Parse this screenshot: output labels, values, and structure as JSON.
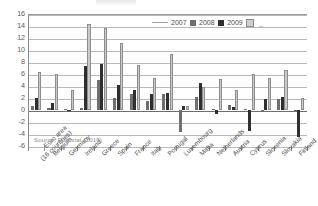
{
  "source_note": "Source:  Eurostat (2010)",
  "legend": {
    "items": [
      {
        "label": "2007",
        "swatch": "solid-gray-swatch",
        "color": "#6f6f6f"
      },
      {
        "label": "2008",
        "swatch": "solid-black-swatch",
        "color": "#2f2f2f"
      },
      {
        "label": "2009",
        "swatch": "light-pattern-swatch",
        "color": "#cfcfcf"
      }
    ],
    "trailing_marker": "_"
  },
  "chart_data": {
    "type": "bar",
    "title": "",
    "xlabel": "",
    "ylabel": "",
    "ylim": [
      -6,
      16
    ],
    "ytick_step": 2,
    "yticks": [
      16,
      14,
      12,
      10,
      8,
      6,
      4,
      2,
      0,
      -2,
      -4,
      -6
    ],
    "ytick_labels": [
      "16",
      "14",
      "12",
      "10",
      "8",
      "6",
      "4",
      "2",
      "0",
      "-2",
      "-4",
      "-6"
    ],
    "grid": true,
    "legend_position": "top-right",
    "categories": [
      "Euro area\n(16 countries)",
      "Belgium",
      "Germany",
      "Ireland",
      "Greece",
      "Spain",
      "France",
      "Italy",
      "Portugal",
      "Luxembourg",
      "Malta",
      "Netherlands",
      "Austria",
      "Cyprus",
      "Slovenia",
      "Slovakia",
      "Finland"
    ],
    "category_lines": [
      [
        "Euro area",
        "(16 countries)"
      ],
      [
        "Belgium"
      ],
      [
        "Germany"
      ],
      [
        "Ireland"
      ],
      [
        "Greece"
      ],
      [
        "Spain"
      ],
      [
        "France"
      ],
      [
        "Italy"
      ],
      [
        "Portugal"
      ],
      [
        "Luxembourg"
      ],
      [
        "Malta"
      ],
      [
        "Netherlands"
      ],
      [
        "Austria"
      ],
      [
        "Cyprus"
      ],
      [
        "Slovenia"
      ],
      [
        "Slovakia"
      ],
      [
        "Finland"
      ]
    ],
    "series": [
      {
        "name": "2007",
        "color": "#6f6f6f",
        "values": [
          0.6,
          0.3,
          0.2,
          0.3,
          5.0,
          2.0,
          2.6,
          1.5,
          2.6,
          -3.7,
          2.1,
          0.2,
          0.8,
          0.2,
          0.0,
          1.8,
          0.0
        ]
      },
      {
        "name": "2008",
        "color": "#2f2f2f",
        "values": [
          2.0,
          1.2,
          0.0,
          7.3,
          7.7,
          4.1,
          3.3,
          2.7,
          2.8,
          0.7,
          4.5,
          -0.7,
          0.5,
          -3.5,
          1.8,
          2.1,
          -4.5
        ]
      },
      {
        "name": "2009",
        "color": "#cfcfcf",
        "values": [
          6.3,
          6.0,
          3.3,
          14.3,
          13.6,
          11.2,
          7.5,
          5.3,
          9.4,
          0.7,
          3.8,
          5.2,
          3.3,
          6.0,
          5.4,
          6.7,
          2.0
        ]
      }
    ]
  }
}
